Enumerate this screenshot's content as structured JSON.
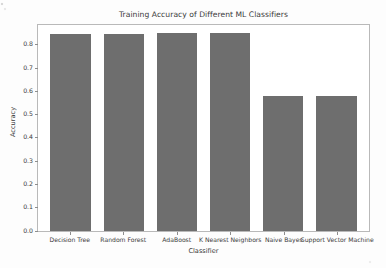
{
  "chart_data": {
    "type": "bar",
    "title": "Training Accuracy of Different ML Classifiers",
    "xlabel": "Classifier",
    "ylabel": "Accuracy",
    "categories": [
      "Decision Tree",
      "Random Forest",
      "AdaBoost",
      "K Nearest Neighbors",
      "Naive Bayes",
      "Support Vector Machine"
    ],
    "values": [
      0.845,
      0.847,
      0.849,
      0.851,
      0.58,
      0.58
    ],
    "ylim": [
      0.0,
      0.885
    ],
    "yticks": [
      "0.0",
      "0.1",
      "0.2",
      "0.3",
      "0.4",
      "0.5",
      "0.6",
      "0.7",
      "0.8"
    ],
    "ytick_values": [
      0.0,
      0.1,
      0.2,
      0.3,
      0.4,
      0.5,
      0.6,
      0.7,
      0.8
    ],
    "grid": false,
    "legend": false,
    "bar_color": "#6e6e6e",
    "background_color": "#ffffff",
    "axis_color": "#b9b9b9"
  }
}
